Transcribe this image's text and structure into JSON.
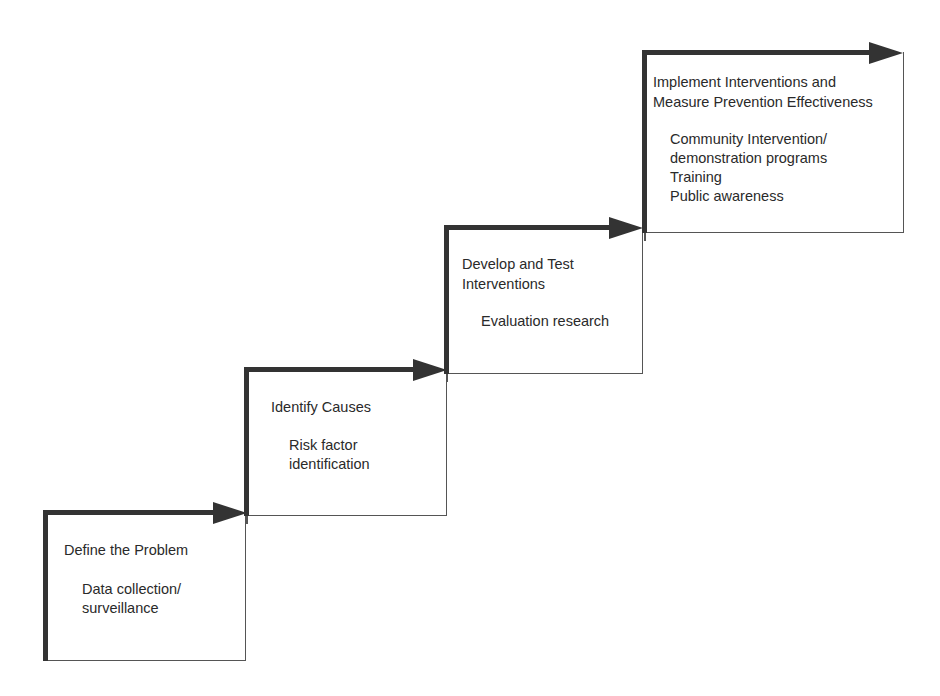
{
  "diagram": {
    "type": "staircase-process",
    "steps": [
      {
        "title_lines": [
          "Define the Problem"
        ],
        "detail_lines": [
          "Data collection/",
          "surveillance"
        ]
      },
      {
        "title_lines": [
          "Identify Causes"
        ],
        "detail_lines": [
          "Risk factor",
          "identification"
        ]
      },
      {
        "title_lines": [
          "Develop and Test",
          "Interventions"
        ],
        "detail_lines": [
          "Evaluation research"
        ]
      },
      {
        "title_lines": [
          "Implement Interventions and",
          "Measure Prevention Effectiveness"
        ],
        "detail_lines": [
          "Community Intervention/",
          "demonstration programs",
          "Training",
          "Public awareness"
        ]
      }
    ],
    "colors": {
      "line": "#333333",
      "thin_line": "#555555",
      "text": "#2a2a2a",
      "background": "#ffffff"
    }
  }
}
